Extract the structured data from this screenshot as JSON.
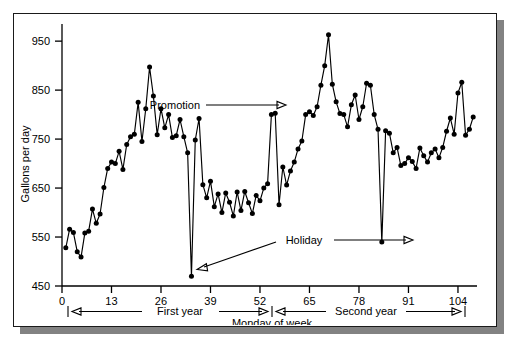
{
  "figure": {
    "background_color": "#ffffff",
    "frame_color": "#1a1a1a",
    "shadow_color": "#828282",
    "series_color": "#000000"
  },
  "annotations": {
    "promotion_label": "Promotion",
    "holiday_label": "Holiday",
    "first_year_label": "First year",
    "second_year_label": "Second year",
    "x_axis_caption": "Monday of week"
  },
  "chart_data": {
    "type": "line",
    "title": "",
    "subtitle": "",
    "xlabel": "Monday of week",
    "ylabel": "Gallons per day",
    "xlim": [
      0,
      109
    ],
    "ylim": [
      450,
      985
    ],
    "grid": false,
    "legend": null,
    "markers": "filled-circle",
    "xticks": [
      0,
      13,
      26,
      39,
      52,
      65,
      78,
      91,
      104
    ],
    "xtick_labels": [
      "0",
      "13",
      "26",
      "39",
      "52",
      "65",
      "78",
      "91",
      "104"
    ],
    "yticks": [
      450,
      550,
      650,
      750,
      850,
      950
    ],
    "ytick_labels": [
      "450",
      "550",
      "650",
      "750",
      "850",
      "950"
    ],
    "series": [
      {
        "name": "Gallons per day",
        "x": [
          1,
          2,
          3,
          4,
          5,
          6,
          7,
          8,
          9,
          10,
          11,
          12,
          13,
          14,
          15,
          16,
          17,
          18,
          19,
          20,
          21,
          22,
          23,
          24,
          25,
          26,
          27,
          28,
          29,
          30,
          31,
          32,
          33,
          34,
          35,
          36,
          37,
          38,
          39,
          40,
          41,
          42,
          43,
          44,
          45,
          46,
          47,
          48,
          49,
          50,
          51,
          52,
          53,
          54,
          55,
          56,
          57,
          58,
          59,
          60,
          61,
          62,
          63,
          64,
          65,
          66,
          67,
          68,
          69,
          70,
          71,
          72,
          73,
          74,
          75,
          76,
          77,
          78,
          79,
          80,
          81,
          82,
          83,
          84,
          85,
          86,
          87,
          88,
          89,
          90,
          91,
          92,
          93,
          94,
          95,
          96,
          97,
          98,
          99,
          100,
          101,
          102,
          103,
          104,
          105,
          106,
          107,
          108
        ],
        "values": [
          528,
          566,
          559,
          520,
          509,
          558,
          562,
          607,
          578,
          597,
          651,
          690,
          703,
          700,
          725,
          688,
          739,
          755,
          760,
          825,
          745,
          812,
          897,
          838,
          759,
          812,
          773,
          800,
          753,
          757,
          790,
          755,
          722,
          470,
          748,
          792,
          657,
          630,
          664,
          612,
          638,
          600,
          640,
          621,
          593,
          642,
          604,
          643,
          620,
          598,
          635,
          624,
          650,
          659,
          800,
          803,
          616,
          693,
          656,
          685,
          703,
          730,
          746,
          800,
          806,
          798,
          816,
          860,
          900,
          963,
          862,
          826,
          802,
          800,
          775,
          820,
          840,
          790,
          816,
          864,
          860,
          800,
          770,
          540,
          767,
          762,
          722,
          733,
          696,
          700,
          712,
          704,
          690,
          732,
          716,
          703,
          722,
          730,
          712,
          733,
          766,
          793,
          760,
          844,
          866,
          758,
          770,
          795
        ]
      }
    ],
    "annotations": [
      {
        "label": "Promotion",
        "points_to_x": 55,
        "points_to_y": 800,
        "note": "spike during promotional week"
      },
      {
        "label": "Holiday",
        "points_to_x": 34,
        "points_to_y": 470,
        "note": "first-year holiday dip"
      },
      {
        "label": "Holiday",
        "points_to_x": 84,
        "points_to_y": 540,
        "note": "second-year holiday dip"
      }
    ],
    "spans": [
      {
        "label": "First year",
        "from_x": 1,
        "to_x": 52
      },
      {
        "label": "Second year",
        "from_x": 53,
        "to_x": 105
      }
    ]
  }
}
